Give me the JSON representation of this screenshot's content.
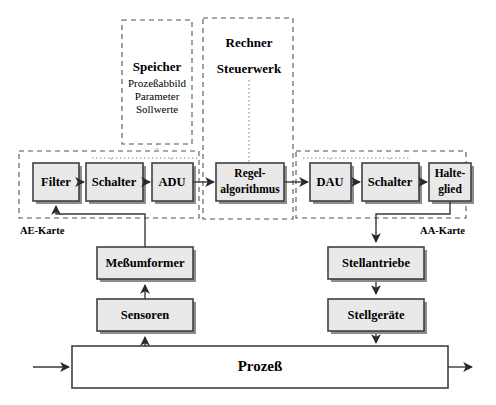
{
  "diagram": {
    "colors": {
      "box_fill": "#e9e9e9",
      "box_stroke": "#404040",
      "box_shadow": "#8d8d8d",
      "dashed_stroke": "#555555",
      "dotted_stroke": "#8a8a8a",
      "flow_line": "#3a3a3a",
      "background": "#ffffff"
    },
    "groups": {
      "speicher": {
        "title": "Speicher",
        "lines": [
          "Prozeßabbild",
          "Parameter",
          "Sollwerte"
        ]
      },
      "rechner": {
        "title": "Rechner",
        "subtitle": "Steuerwerk"
      },
      "ae_karte": {
        "label": "AE-Karte"
      },
      "aa_karte": {
        "label": "AA-Karte"
      }
    },
    "blocks": {
      "filter": "Filter",
      "schalter_in": "Schalter",
      "adu": "ADU",
      "regelalgorithmus_line1": "Regel-",
      "regelalgorithmus_line2": "algorithmus",
      "dau": "DAU",
      "schalter_out": "Schalter",
      "halteglied_line1": "Halte-",
      "halteglied_line2": "glied",
      "messumformer": "Meßumformer",
      "sensoren": "Sensoren",
      "stellantriebe": "Stellantriebe",
      "stellgeraete": "Stellgeräte",
      "prozess": "Prozeß"
    }
  }
}
